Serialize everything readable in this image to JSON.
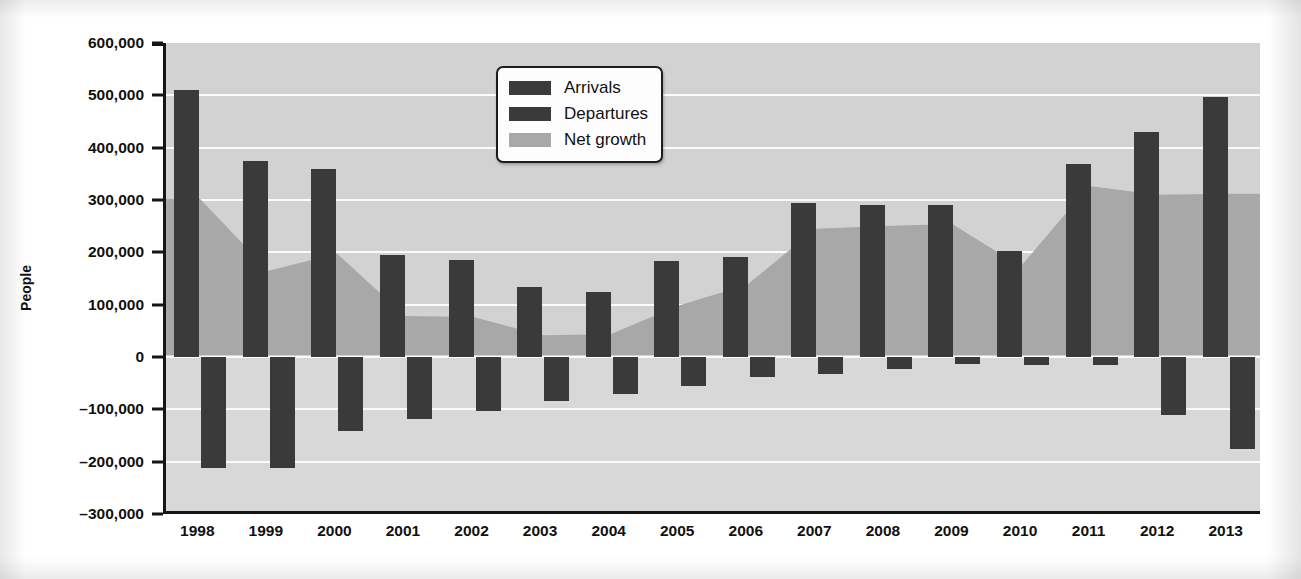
{
  "chart_data": {
    "type": "bar",
    "title": "",
    "subtitle": "",
    "xlabel": "",
    "ylabel": "People",
    "ylim": [
      -300000,
      600000
    ],
    "ytick_values": [
      600000,
      500000,
      400000,
      300000,
      200000,
      100000,
      0,
      -100000,
      -200000,
      -300000
    ],
    "ytick_labels": [
      "600,000",
      "500,000",
      "400,000",
      "300,000",
      "200,000",
      "100,000",
      "0",
      "–100,000",
      "–200,000",
      "–300,000"
    ],
    "grid": true,
    "grid_axis": "y",
    "legend_position": "top-center",
    "categories": [
      "1998",
      "1999",
      "2000",
      "2001",
      "2002",
      "2003",
      "2004",
      "2005",
      "2006",
      "2007",
      "2008",
      "2009",
      "2010",
      "2011",
      "2012",
      "2013"
    ],
    "series": [
      {
        "name": "Arrivals",
        "type": "bar",
        "color": "#3a3a3a",
        "values": [
          511000,
          375000,
          360000,
          194000,
          186000,
          133000,
          124000,
          183000,
          192000,
          295000,
          291000,
          291000,
          203000,
          369000,
          430000,
          496000
        ]
      },
      {
        "name": "Departures",
        "type": "bar",
        "color": "#3a3a3a",
        "values": [
          -212000,
          -212000,
          -142000,
          -118000,
          -103000,
          -85000,
          -70000,
          -56000,
          -38000,
          -33000,
          -23000,
          -13000,
          -15000,
          -15000,
          -110000,
          -175000
        ]
      },
      {
        "name": "Net growth",
        "type": "area",
        "color": "#a8a8a8",
        "values": [
          300000,
          162000,
          195000,
          75000,
          73000,
          38000,
          40000,
          95000,
          135000,
          243000,
          248000,
          252000,
          170000,
          325000,
          308000,
          310000
        ]
      }
    ]
  },
  "legend": {
    "items": [
      {
        "label": "Arrivals",
        "color": "#3a3a3a"
      },
      {
        "label": "Departures",
        "color": "#3a3a3a"
      },
      {
        "label": "Net growth",
        "color": "#a8a8a8"
      }
    ]
  },
  "axes": {
    "y_title": "People"
  }
}
